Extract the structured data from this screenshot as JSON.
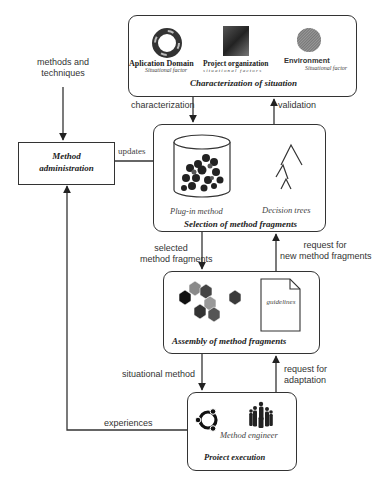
{
  "diagram": {
    "inputs": {
      "methods_and_techniques_line1": "methods and",
      "methods_and_techniques_line2": "techniques"
    },
    "characterization": {
      "title": "Characterization of situation",
      "factors": [
        {
          "name": "Aplication Domain",
          "sub": "Situational factor",
          "icon": "lifebuoy-icon"
        },
        {
          "name": "Project organization",
          "sub": "situational factors",
          "icon": "team-photo-icon"
        },
        {
          "name": "Environment",
          "sub": "Situational factor",
          "icon": "globe-icon"
        }
      ]
    },
    "method_administration": {
      "line1": "Method",
      "line2": "administration"
    },
    "selection": {
      "title": "Selection of method fragments",
      "plugin_label": "Plug-in method",
      "decision_label": "Decision trees"
    },
    "assembly": {
      "title": "Assembly of method fragments",
      "guidelines_label": "guidelines"
    },
    "project_execution": {
      "title": "Proiect execution",
      "engineer_label": "Method engineer"
    },
    "arrows": {
      "characterization": "characterization",
      "validation": "validation",
      "updates": "updates",
      "selected_line1": "selected",
      "selected_line2": "method fragments",
      "request_new_line1": "request for",
      "request_new_line2": "new method fragments",
      "situational_method": "situational method",
      "request_adapt_line1": "request for",
      "request_adapt_line2": "adaptation",
      "experiences": "experiences"
    },
    "colors": {
      "line": "#333333",
      "fragment_dark": "#222222",
      "fragment_mid": "#555555",
      "fragment_light": "#8a8a8a"
    }
  }
}
